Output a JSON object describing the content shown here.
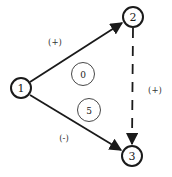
{
  "diagram": {
    "type": "signed-directed-graph",
    "colors": {
      "stroke": "#1a1a1a",
      "background": "#ffffff"
    },
    "nodes": [
      {
        "id": "1",
        "label": "1",
        "x": 21,
        "y": 88
      },
      {
        "id": "2",
        "label": "2",
        "x": 133,
        "y": 17
      },
      {
        "id": "3",
        "label": "3",
        "x": 132,
        "y": 156
      }
    ],
    "inner_markers": [
      {
        "label": "0",
        "x": 83,
        "y": 74
      },
      {
        "label": "5",
        "x": 89,
        "y": 110
      }
    ],
    "edges": [
      {
        "from": "1",
        "to": "2",
        "style": "solid",
        "sign": "(+)"
      },
      {
        "from": "1",
        "to": "3",
        "style": "solid",
        "sign": "(-)"
      },
      {
        "from": "2",
        "to": "3",
        "style": "dashed",
        "sign": "(+)"
      }
    ],
    "edge_labels": [
      {
        "text": "(+)",
        "x": 55,
        "y": 45
      },
      {
        "text": "(-)",
        "x": 64,
        "y": 141
      },
      {
        "text": "(+)",
        "x": 155,
        "y": 93
      }
    ]
  }
}
